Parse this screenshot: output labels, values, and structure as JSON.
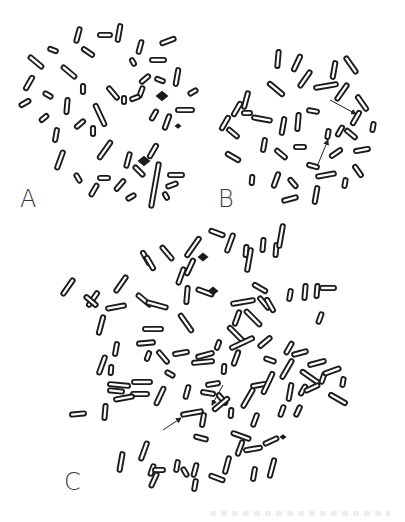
{
  "figure": {
    "panels": [
      {
        "id": "A",
        "label": "A",
        "label_pos": [
          20,
          187
        ],
        "chromosomes": [
          [
            78,
            35,
            8,
            -75
          ],
          [
            105,
            35,
            7,
            0
          ],
          [
            119,
            33,
            9,
            -80
          ],
          [
            53,
            50,
            5,
            20
          ],
          [
            88,
            52,
            7,
            35
          ],
          [
            36,
            62,
            9,
            40
          ],
          [
            69,
            72,
            9,
            40
          ],
          [
            29,
            83,
            8,
            -60
          ],
          [
            48,
            95,
            5,
            30
          ],
          [
            83,
            89,
            5,
            90
          ],
          [
            113,
            93,
            8,
            50
          ],
          [
            141,
            92,
            6,
            -70
          ],
          [
            25,
            103,
            6,
            -30
          ],
          [
            67,
            106,
            8,
            -85
          ],
          [
            100,
            115,
            12,
            65
          ],
          [
            44,
            118,
            5,
            -40
          ],
          [
            80,
            124,
            6,
            -40
          ],
          [
            124,
            100,
            4,
            90
          ],
          [
            93,
            131,
            5,
            90
          ],
          [
            135,
            98,
            5,
            -20
          ],
          [
            56,
            135,
            7,
            -80
          ],
          [
            168,
            41,
            8,
            -20
          ],
          [
            140,
            47,
            7,
            -75
          ],
          [
            158,
            60,
            8,
            0
          ],
          [
            133,
            62,
            4,
            60
          ],
          [
            145,
            79,
            6,
            -40
          ],
          [
            160,
            80,
            5,
            20
          ],
          [
            177,
            77,
            9,
            -80
          ],
          [
            193,
            92,
            5,
            -30
          ],
          [
            185,
            110,
            9,
            0
          ],
          [
            154,
            115,
            6,
            -60
          ],
          [
            167,
            122,
            8,
            -70
          ],
          [
            60,
            160,
            10,
            -70
          ],
          [
            105,
            150,
            11,
            -55
          ],
          [
            128,
            160,
            8,
            -75
          ],
          [
            153,
            151,
            8,
            -60
          ],
          [
            139,
            171,
            7,
            45
          ],
          [
            176,
            175,
            8,
            0
          ],
          [
            78,
            178,
            5,
            60
          ],
          [
            104,
            178,
            6,
            0
          ],
          [
            94,
            190,
            7,
            -60
          ],
          [
            120,
            185,
            7,
            -50
          ],
          [
            131,
            197,
            5,
            -30
          ],
          [
            155,
            185,
            23,
            -80
          ],
          [
            172,
            185,
            6,
            -20
          ],
          [
            166,
            196,
            4,
            60
          ]
        ],
        "solids": [
          [
            162,
            96,
            5
          ],
          [
            144,
            161,
            5
          ],
          [
            178,
            126,
            2
          ]
        ],
        "arrows": []
      },
      {
        "id": "B",
        "label": "B",
        "label_pos": [
          218,
          187
        ],
        "chromosomes": [
          [
            278,
            59,
            9,
            -85
          ],
          [
            297,
            63,
            9,
            -65
          ],
          [
            305,
            79,
            10,
            -55
          ],
          [
            276,
            89,
            10,
            40
          ],
          [
            326,
            86,
            12,
            -10
          ],
          [
            334,
            70,
            9,
            -80
          ],
          [
            351,
            65,
            10,
            55
          ],
          [
            342,
            92,
            10,
            -55
          ],
          [
            362,
            103,
            9,
            55
          ],
          [
            246,
            100,
            9,
            -75
          ],
          [
            237,
            109,
            8,
            -60
          ],
          [
            225,
            123,
            8,
            -60
          ],
          [
            233,
            133,
            7,
            40
          ],
          [
            262,
            119,
            10,
            10
          ],
          [
            283,
            126,
            9,
            -80
          ],
          [
            298,
            122,
            9,
            -85
          ],
          [
            313,
            111,
            6,
            10
          ],
          [
            328,
            134,
            5,
            -80
          ],
          [
            340,
            131,
            6,
            -60
          ],
          [
            351,
            134,
            7,
            40
          ],
          [
            356,
            118,
            8,
            -60
          ],
          [
            373,
            127,
            5,
            -80
          ],
          [
            264,
            145,
            7,
            -80
          ],
          [
            281,
            154,
            7,
            40
          ],
          [
            300,
            147,
            6,
            0
          ],
          [
            313,
            166,
            6,
            15
          ],
          [
            336,
            153,
            7,
            -35
          ],
          [
            362,
            150,
            8,
            -10
          ],
          [
            233,
            157,
            8,
            30
          ],
          [
            252,
            180,
            5,
            -85
          ],
          [
            276,
            180,
            8,
            -70
          ],
          [
            293,
            183,
            6,
            50
          ],
          [
            326,
            175,
            10,
            -10
          ],
          [
            358,
            171,
            7,
            55
          ],
          [
            345,
            183,
            5,
            -80
          ],
          [
            290,
            199,
            8,
            -15
          ],
          [
            316,
            195,
            9,
            -80
          ],
          [
            247,
            113,
            5,
            0
          ]
        ],
        "solids": [],
        "arrows": [
          [
            330,
            100,
            356,
            114
          ],
          [
            318,
            164,
            328,
            140
          ]
        ]
      },
      {
        "id": "C",
        "label": "C",
        "label_pos": [
          64,
          475
        ],
        "chromosomes": [
          [
            217,
            233,
            8,
            20
          ],
          [
            230,
            243,
            10,
            -70
          ],
          [
            246,
            251,
            6,
            -85
          ],
          [
            263,
            245,
            7,
            -85
          ],
          [
            276,
            250,
            7,
            -85
          ],
          [
            281,
            236,
            12,
            -80
          ],
          [
            249,
            260,
            12,
            -80
          ],
          [
            193,
            247,
            12,
            -55
          ],
          [
            190,
            267,
            9,
            -65
          ],
          [
            167,
            253,
            9,
            50
          ],
          [
            181,
            276,
            9,
            -70
          ],
          [
            146,
            258,
            8,
            60
          ],
          [
            150,
            263,
            8,
            60
          ],
          [
            121,
            284,
            10,
            -55
          ],
          [
            144,
            300,
            9,
            40
          ],
          [
            93,
            299,
            9,
            -55
          ],
          [
            116,
            307,
            10,
            -10
          ],
          [
            157,
            305,
            11,
            15
          ],
          [
            205,
            292,
            9,
            20
          ],
          [
            187,
            295,
            9,
            -85
          ],
          [
            243,
            302,
            12,
            -10
          ],
          [
            260,
            288,
            8,
            30
          ],
          [
            264,
            303,
            8,
            50
          ],
          [
            237,
            318,
            8,
            -70
          ],
          [
            253,
            318,
            11,
            45
          ],
          [
            270,
            305,
            8,
            60
          ],
          [
            290,
            295,
            6,
            -80
          ],
          [
            305,
            292,
            8,
            -85
          ],
          [
            317,
            291,
            7,
            -85
          ],
          [
            328,
            288,
            8,
            0
          ],
          [
            320,
            318,
            6,
            -70
          ],
          [
            186,
            323,
            11,
            55
          ],
          [
            153,
            329,
            10,
            0
          ],
          [
            237,
            335,
            12,
            45
          ],
          [
            242,
            343,
            13,
            -25
          ],
          [
            218,
            345,
            5,
            -70
          ],
          [
            116,
            349,
            7,
            -80
          ],
          [
            146,
            343,
            9,
            -5
          ],
          [
            181,
            353,
            8,
            -10
          ],
          [
            205,
            355,
            9,
            -15
          ],
          [
            265,
            342,
            8,
            -40
          ],
          [
            289,
            348,
            7,
            -60
          ],
          [
            270,
            360,
            6,
            20
          ],
          [
            300,
            353,
            8,
            -15
          ],
          [
            317,
            363,
            9,
            -15
          ],
          [
            148,
            356,
            5,
            -70
          ],
          [
            163,
            357,
            8,
            50
          ],
          [
            236,
            358,
            8,
            -70
          ],
          [
            203,
            362,
            11,
            -5
          ],
          [
            224,
            369,
            5,
            -85
          ],
          [
            287,
            369,
            11,
            -60
          ],
          [
            323,
            378,
            6,
            -70
          ],
          [
            310,
            377,
            11,
            35
          ],
          [
            142,
            382,
            10,
            0
          ],
          [
            170,
            374,
            5,
            30
          ],
          [
            119,
            385,
            11,
            5
          ],
          [
            140,
            394,
            9,
            0
          ],
          [
            160,
            396,
            10,
            -65
          ],
          [
            187,
            392,
            7,
            -75
          ],
          [
            208,
            393,
            7,
            10
          ],
          [
            213,
            384,
            7,
            -10
          ],
          [
            222,
            399,
            7,
            50
          ],
          [
            248,
            398,
            11,
            -60
          ],
          [
            259,
            385,
            8,
            -10
          ],
          [
            268,
            383,
            12,
            -65
          ],
          [
            290,
            392,
            9,
            -80
          ],
          [
            303,
            390,
            6,
            -60
          ],
          [
            312,
            388,
            8,
            -25
          ],
          [
            343,
            382,
            5,
            -80
          ],
          [
            338,
            399,
            10,
            30
          ],
          [
            332,
            371,
            9,
            -20
          ],
          [
            282,
            411,
            6,
            -70
          ],
          [
            298,
            411,
            6,
            -65
          ],
          [
            221,
            404,
            10,
            -40
          ],
          [
            192,
            413,
            11,
            -10
          ],
          [
            203,
            420,
            7,
            -80
          ],
          [
            231,
            413,
            5,
            -85
          ],
          [
            255,
            420,
            7,
            -70
          ],
          [
            241,
            436,
            10,
            20
          ],
          [
            253,
            449,
            9,
            -10
          ],
          [
            240,
            448,
            8,
            -70
          ],
          [
            271,
            441,
            8,
            -25
          ],
          [
            227,
            465,
            9,
            -75
          ],
          [
            201,
            438,
            7,
            15
          ],
          [
            144,
            451,
            10,
            -70
          ],
          [
            121,
            462,
            10,
            -80
          ],
          [
            152,
            470,
            6,
            -70
          ],
          [
            159,
            470,
            6,
            0
          ],
          [
            195,
            470,
            7,
            -75
          ],
          [
            185,
            472,
            5,
            60
          ],
          [
            217,
            478,
            8,
            20
          ],
          [
            254,
            474,
            7,
            -80
          ],
          [
            272,
            468,
            10,
            -75
          ],
          [
            177,
            466,
            6,
            -80
          ],
          [
            154,
            480,
            8,
            -65
          ],
          [
            195,
            485,
            6,
            -80
          ],
          [
            105,
            412,
            8,
            -85
          ],
          [
            101,
            325,
            10,
            -75
          ],
          [
            102,
            365,
            10,
            -70
          ],
          [
            116,
            391,
            8,
            5
          ],
          [
            124,
            398,
            10,
            -10
          ],
          [
            68,
            287,
            10,
            -55
          ],
          [
            91,
            301,
            8,
            40
          ],
          [
            78,
            414,
            8,
            -5
          ],
          [
            111,
            370,
            5,
            -85
          ]
        ],
        "solids": [
          [
            203,
            257,
            4
          ],
          [
            213,
            291,
            4
          ],
          [
            283,
            437,
            2
          ]
        ],
        "arrows": [
          [
            163,
            430,
            181,
            418
          ],
          [
            223,
            385,
            212,
            405
          ]
        ]
      }
    ],
    "bottom_caption_bleed": ""
  }
}
